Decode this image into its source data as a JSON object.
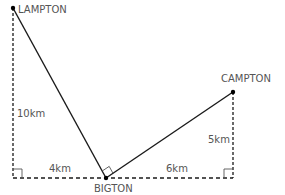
{
  "diagram": {
    "type": "geometry-map",
    "points": {
      "lampton": {
        "label": "LAMPTON",
        "x": 13,
        "y": 8
      },
      "bigton": {
        "label": "BIGTON",
        "x": 106,
        "y": 178
      },
      "campton": {
        "label": "CAMPTON",
        "x": 233,
        "y": 92
      }
    },
    "distances": {
      "lampton_vertical": "10km",
      "lampton_horizontal": "4km",
      "campton_horizontal": "6km",
      "campton_vertical": "5km"
    },
    "colors": {
      "line": "#1a1a1a",
      "text": "#555555"
    }
  }
}
